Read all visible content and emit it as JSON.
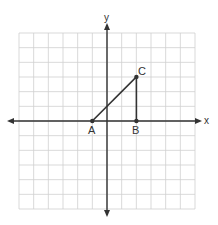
{
  "graph": {
    "grid": {
      "cols": 12,
      "rows": 12,
      "x_min": -6,
      "x_max": 6,
      "y_min": -6,
      "y_max": 6,
      "line_color": "#cfcfcf"
    },
    "axes": {
      "x_label": "x",
      "y_label": "y",
      "color": "#333333"
    },
    "points": [
      {
        "label": "A",
        "x": -1,
        "y": 0
      },
      {
        "label": "B",
        "x": 2,
        "y": 0
      },
      {
        "label": "C",
        "x": 2,
        "y": 3
      }
    ],
    "segments": [
      {
        "from": "A",
        "to": "C"
      },
      {
        "from": "C",
        "to": "B"
      }
    ]
  }
}
